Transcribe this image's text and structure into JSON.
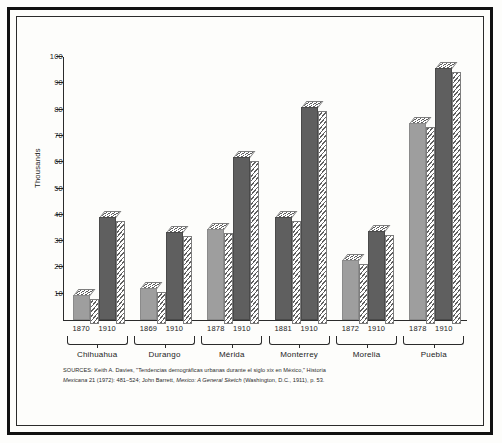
{
  "chart_data": {
    "type": "bar",
    "title": "",
    "xlabel": "",
    "ylabel": "Thousands",
    "ylim": [
      0,
      100
    ],
    "ytick_labels": [
      "10",
      "20",
      "30",
      "40",
      "50",
      "60",
      "70",
      "80",
      "90",
      "100"
    ],
    "ytick_values": [
      10,
      20,
      30,
      40,
      50,
      60,
      70,
      80,
      90,
      100
    ],
    "grid": false,
    "legend": "none",
    "categories": [
      "Chihuahua",
      "Durango",
      "Mérida",
      "Monterrey",
      "Morelia",
      "Puebla"
    ],
    "series": [
      {
        "name": "early year",
        "years": [
          "1870",
          "1869",
          "1878",
          "1881",
          "1872",
          "1878"
        ],
        "values": [
          9.5,
          12,
          34.5,
          39,
          23,
          75
        ]
      },
      {
        "name": "1910",
        "years": [
          "1910",
          "1910",
          "1910",
          "1910",
          "1910",
          "1910"
        ],
        "values": [
          39,
          33.5,
          62,
          81,
          34,
          96
        ]
      }
    ],
    "groups": [
      {
        "city": "Chihuahua",
        "bars": [
          {
            "year": "1870",
            "value": 9.5,
            "shade": "light"
          },
          {
            "year": "1910",
            "value": 39,
            "shade": "dark"
          }
        ]
      },
      {
        "city": "Durango",
        "bars": [
          {
            "year": "1869",
            "value": 12,
            "shade": "light"
          },
          {
            "year": "1910",
            "value": 33.5,
            "shade": "dark"
          }
        ]
      },
      {
        "city": "Mérida",
        "bars": [
          {
            "year": "1878",
            "value": 34.5,
            "shade": "light"
          },
          {
            "year": "1910",
            "value": 62,
            "shade": "dark"
          }
        ]
      },
      {
        "city": "Monterrey",
        "bars": [
          {
            "year": "1881",
            "value": 39,
            "shade": "dark"
          },
          {
            "year": "1910",
            "value": 81,
            "shade": "dark"
          }
        ]
      },
      {
        "city": "Morelia",
        "bars": [
          {
            "year": "1872",
            "value": 23,
            "shade": "light"
          },
          {
            "year": "1910",
            "value": 34,
            "shade": "dark"
          }
        ]
      },
      {
        "city": "Puebla",
        "bars": [
          {
            "year": "1878",
            "value": 75,
            "shade": "light"
          },
          {
            "year": "1910",
            "value": 96,
            "shade": "dark"
          }
        ]
      }
    ],
    "colors": {
      "bar_dark": "#5f5f5f",
      "bar_light": "#9e9e9e",
      "axis": "#2b2b2b",
      "background": "#fdfdfb"
    }
  },
  "sources": {
    "line1": "SOURCES: Keith A. Davies, \"Tendencias demográficas urbanas durante el siglo xix en México,\" Historia",
    "line2_a": "Mexicana",
    "line2_b": " 21 (1972): 481–524; John Barrett, ",
    "line2_c": "Mexico: A General Sketch",
    "line2_d": " (Washington, D.C., 1911), p. 53."
  }
}
